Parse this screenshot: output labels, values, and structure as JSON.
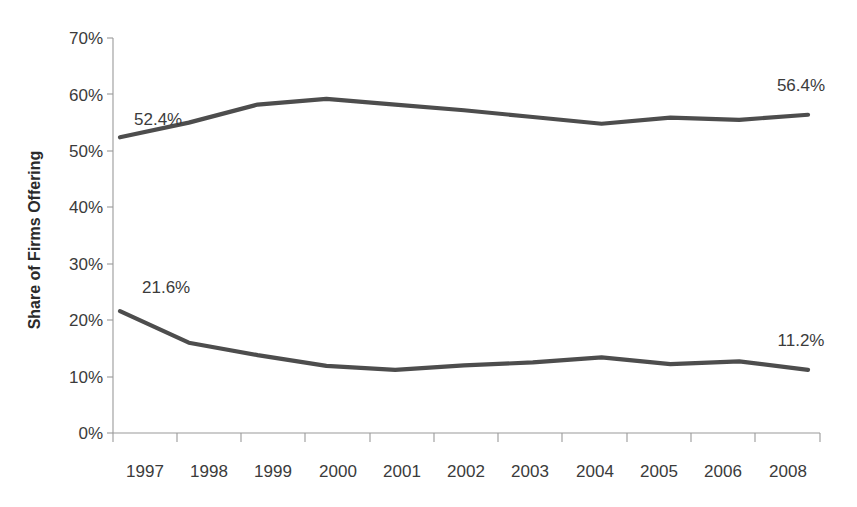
{
  "chart_data": {
    "type": "line",
    "title": "",
    "xlabel": "",
    "ylabel": "Share of Firms Offering",
    "categories": [
      "1997",
      "1998",
      "1999",
      "2000",
      "2001",
      "2002",
      "2003",
      "2004",
      "2005",
      "2006",
      "2008"
    ],
    "ylim": [
      0,
      70
    ],
    "ytick_labels": [
      "0%",
      "10%",
      "20%",
      "30%",
      "40%",
      "50%",
      "60%",
      "70%"
    ],
    "ytick_values": [
      0,
      10,
      20,
      30,
      40,
      50,
      60,
      70
    ],
    "grid": false,
    "legend_position": "none",
    "series": [
      {
        "name": "upper-series",
        "values": [
          52.4,
          55.0,
          58.2,
          59.2,
          58.2,
          57.2,
          56.0,
          54.8,
          55.9,
          55.5,
          56.4
        ],
        "color": "#4d4d4d",
        "start_label": "52.4%",
        "end_label": "56.4%"
      },
      {
        "name": "lower-series",
        "values": [
          21.6,
          16.0,
          13.8,
          11.9,
          11.2,
          12.0,
          12.5,
          13.4,
          12.2,
          12.7,
          11.2
        ],
        "color": "#4d4d4d",
        "start_label": "21.6%",
        "end_label": "11.2%"
      }
    ],
    "annotations": [
      {
        "text": "52.4%",
        "series": "upper-series",
        "position": "start-above"
      },
      {
        "text": "56.4%",
        "series": "upper-series",
        "position": "end-above"
      },
      {
        "text": "21.6%",
        "series": "lower-series",
        "position": "start-above"
      },
      {
        "text": "11.2%",
        "series": "lower-series",
        "position": "end-above"
      }
    ]
  },
  "axis": {
    "y_title": "Share of Firms Offering",
    "y_ticks": [
      "70%",
      "60%",
      "50%",
      "40%",
      "30%",
      "20%",
      "10%",
      "0%"
    ],
    "x_ticks": [
      "1997",
      "1998",
      "1999",
      "2000",
      "2001",
      "2002",
      "2003",
      "2004",
      "2005",
      "2006",
      "2008"
    ]
  },
  "labels": {
    "upper_start": "52.4%",
    "upper_end": "56.4%",
    "lower_start": "21.6%",
    "lower_end": "11.2%"
  },
  "colors": {
    "line": "#4d4d4d",
    "axis": "#9a9a9a",
    "text": "#3b3b3b",
    "background": "#ffffff"
  }
}
